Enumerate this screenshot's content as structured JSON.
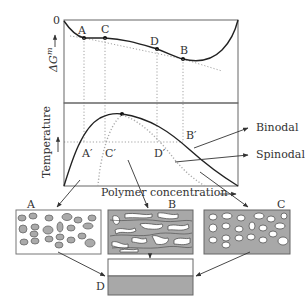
{
  "diagram": {
    "top_panel": {
      "y_axis_label": "ΔG",
      "y_axis_sup": "m",
      "zero_label": "0",
      "points": [
        {
          "label": "A",
          "x": 84,
          "y": 38
        },
        {
          "label": "C",
          "x": 105,
          "y": 38
        },
        {
          "label": "D",
          "x": 157,
          "y": 49
        },
        {
          "label": "B",
          "x": 183,
          "y": 59
        }
      ]
    },
    "bottom_panel": {
      "y_axis_label": "Temperature",
      "x_axis_label": "Polymer concentration",
      "primes": [
        {
          "label": "A′",
          "x": 84
        },
        {
          "label": "C′",
          "x": 105
        },
        {
          "label": "D′",
          "x": 157
        },
        {
          "label": "B′",
          "x": 191
        }
      ],
      "curves": [
        {
          "name": "Binodal"
        },
        {
          "name": "Spinodal"
        }
      ]
    },
    "morphologies": [
      {
        "label": "A",
        "description": "polymer-lean droplets in polymer-rich matrix"
      },
      {
        "label": "B",
        "description": "bicontinuous structure"
      },
      {
        "label": "C",
        "description": "polymer-rich droplets in lean matrix"
      },
      {
        "label": "D",
        "description": "two layers (separated phases)"
      }
    ]
  },
  "colors": {
    "gray_fill": "#a8a8a8",
    "line": "#222222",
    "white": "#ffffff"
  }
}
